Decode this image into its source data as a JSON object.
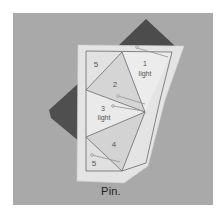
{
  "figure": {
    "caption": "Pin.",
    "colors": {
      "background_frame": "#ffffff",
      "photo_background": "#a9a9a9",
      "paper": "#e6e6e6",
      "paper_light_section": "#ececec",
      "paper_mid_section": "#d6d6d6",
      "dark_fabric": "#4e4e4e",
      "pattern_lines": "#6a6a6a"
    }
  },
  "pattern": {
    "sections": [
      {
        "number": "5",
        "fabric": ""
      },
      {
        "number": "1",
        "fabric": "light"
      },
      {
        "number": "2",
        "fabric": ""
      },
      {
        "number": "3",
        "fabric": "light"
      },
      {
        "number": "4",
        "fabric": ""
      },
      {
        "number": "5",
        "fabric": ""
      }
    ]
  }
}
